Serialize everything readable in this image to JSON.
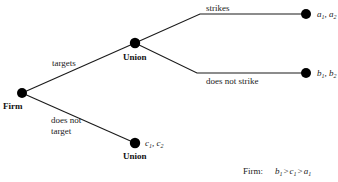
{
  "diagram": {
    "type": "game-tree",
    "players": {
      "firm": "Firm",
      "union": "Union"
    },
    "nodes": [
      {
        "id": "firm",
        "label": "Firm",
        "kind": "decision"
      },
      {
        "id": "union_top",
        "label": "Union",
        "kind": "decision"
      },
      {
        "id": "union_bottom",
        "label": "Union",
        "kind": "terminal",
        "payoff": {
          "p1": "c",
          "p2": "c",
          "sub1": "1",
          "sub2": "2"
        }
      },
      {
        "id": "strike_end",
        "label": "",
        "kind": "terminal",
        "payoff": {
          "p1": "a",
          "p2": "a",
          "sub1": "1",
          "sub2": "2"
        }
      },
      {
        "id": "nostrike_end",
        "label": "",
        "kind": "terminal",
        "payoff": {
          "p1": "b",
          "p2": "b",
          "sub1": "1",
          "sub2": "2"
        }
      }
    ],
    "edges": [
      {
        "from": "firm",
        "to": "union_top",
        "label": "targets"
      },
      {
        "from": "firm",
        "to": "union_bottom",
        "label_lines": [
          "does not",
          "target"
        ]
      },
      {
        "from": "union_top",
        "to": "strike_end",
        "label": "strikes"
      },
      {
        "from": "union_top",
        "to": "nostrike_end",
        "label": "does not strike"
      }
    ],
    "preference": {
      "player": "Firm:",
      "order": [
        {
          "v": "b",
          "sub": "1"
        },
        {
          "v": "c",
          "sub": "1"
        },
        {
          "v": "a",
          "sub": "1"
        }
      ],
      "relation": ">"
    }
  }
}
